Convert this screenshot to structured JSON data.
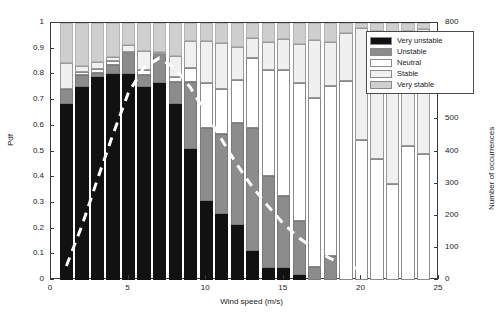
{
  "chart_data": {
    "type": "bar",
    "title": "",
    "xlabel": "Wind speed (m/s)",
    "ylabel": "Pdf",
    "y2label": "Number of occurrences",
    "xlim": [
      0,
      25
    ],
    "ylim": [
      0,
      1
    ],
    "y2lim": [
      0,
      800
    ],
    "grid": false,
    "stacked": true,
    "legend_position": "top-right",
    "xticks": [
      0,
      5,
      10,
      15,
      20,
      25
    ],
    "yticks": [
      0,
      0.1,
      0.2,
      0.3,
      0.4,
      0.5,
      0.6,
      0.7,
      0.8,
      0.9,
      1
    ],
    "y2ticks": [
      0,
      100,
      200,
      300,
      400,
      500,
      600,
      700,
      800
    ],
    "categories": [
      1,
      2,
      3,
      4,
      5,
      6,
      7,
      8,
      9,
      10,
      11,
      12,
      13,
      14,
      15,
      16,
      17,
      18,
      19,
      20,
      21,
      22,
      23,
      24
    ],
    "series": [
      {
        "name": "Very unstable",
        "color": "#111111",
        "values": [
          0.685,
          0.75,
          0.79,
          0.803,
          0.803,
          0.752,
          0.765,
          0.685,
          0.508,
          0.307,
          0.255,
          0.215,
          0.113,
          0.047,
          0.045,
          0.018,
          0.0,
          0.0,
          0.0,
          0.0,
          0.0,
          0.0,
          0.0,
          0.0
        ]
      },
      {
        "name": "Unstable",
        "color": "#8c8c8c",
        "values": [
          0.06,
          0.048,
          0.015,
          0.035,
          0.083,
          0.047,
          0.113,
          0.085,
          0.262,
          0.283,
          0.315,
          0.395,
          0.478,
          0.357,
          0.283,
          0.213,
          0.05,
          0.095,
          0.0,
          0.0,
          0.0,
          0.0,
          0.0,
          0.0
        ]
      },
      {
        "name": "Neutral",
        "color": "#ffffff",
        "values": [
          0.0,
          0.01,
          0.017,
          0.013,
          0.003,
          0.02,
          0.003,
          0.018,
          0.055,
          0.175,
          0.175,
          0.168,
          0.272,
          0.413,
          0.49,
          0.537,
          0.66,
          0.66,
          0.775,
          0.545,
          0.47,
          0.375,
          0.52,
          0.49
        ]
      },
      {
        "name": "Stable",
        "color": "#f0f0f0",
        "values": [
          0.1,
          0.025,
          0.028,
          0.015,
          0.025,
          0.072,
          0.008,
          0.085,
          0.105,
          0.165,
          0.178,
          0.13,
          0.077,
          0.108,
          0.12,
          0.15,
          0.225,
          0.17,
          0.188,
          0.435,
          0.5,
          0.59,
          0.45,
          0.485
        ]
      },
      {
        "name": "Very stable",
        "color": "#cfcfcf",
        "values": [
          0.155,
          0.167,
          0.15,
          0.134,
          0.086,
          0.109,
          0.111,
          0.127,
          0.07,
          0.07,
          0.077,
          0.092,
          0.06,
          0.075,
          0.062,
          0.082,
          0.065,
          0.075,
          0.037,
          0.02,
          0.03,
          0.035,
          0.03,
          0.025
        ]
      }
    ],
    "occurrence_line": {
      "name": "Number of occurrences",
      "style": "dashed",
      "color": "#ffffff",
      "x": [
        1,
        2,
        3,
        4,
        5,
        6,
        7,
        8,
        9,
        10,
        11,
        12,
        13,
        14,
        15,
        16,
        17,
        18,
        19,
        20
      ],
      "values": [
        40,
        165,
        310,
        450,
        580,
        660,
        690,
        660,
        600,
        520,
        440,
        360,
        290,
        230,
        175,
        130,
        95,
        65,
        45,
        30
      ]
    }
  },
  "legend": {
    "items": [
      {
        "label": "Very unstable"
      },
      {
        "label": "Unstable"
      },
      {
        "label": "Neutral"
      },
      {
        "label": "Stable"
      },
      {
        "label": "Very stable"
      }
    ]
  }
}
